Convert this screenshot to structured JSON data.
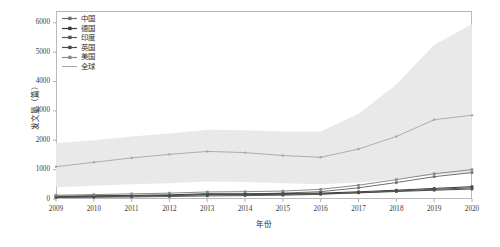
{
  "chart_data": {
    "type": "line",
    "title": "",
    "xlabel": "年份",
    "ylabel": "发文量（篇）",
    "categories": [
      2009,
      2010,
      2011,
      2012,
      2013,
      2014,
      2015,
      2016,
      2017,
      2018,
      2019,
      2020
    ],
    "xtick_labels": [
      "2009",
      "2010",
      "2011",
      "2012",
      "2013",
      "2014",
      "2015",
      "2016",
      "2017",
      "2018",
      "2019",
      "2020"
    ],
    "ytick_labels": [
      "0",
      "1000",
      "2000",
      "3000",
      "4000",
      "5000",
      "6000"
    ],
    "ytick_values": [
      0,
      1000,
      2000,
      3000,
      4000,
      5000,
      6000
    ],
    "ylim": [
      0,
      6400
    ],
    "xlim": [
      2009,
      2020
    ],
    "grid": false,
    "legend_position": "upper-left-inside",
    "series": [
      {
        "name": "中国",
        "color": "#6f6f6f",
        "marker": "square",
        "values": [
          60,
          75,
          95,
          120,
          150,
          170,
          200,
          250,
          380,
          560,
          760,
          900
        ]
      },
      {
        "name": "德国",
        "color": "#3a3a3a",
        "marker": "square",
        "values": [
          95,
          110,
          125,
          140,
          180,
          175,
          185,
          200,
          245,
          300,
          360,
          420
        ]
      },
      {
        "name": "印度",
        "color": "#565656",
        "marker": "square",
        "values": [
          50,
          60,
          70,
          85,
          105,
          115,
          130,
          160,
          215,
          275,
          330,
          380
        ]
      },
      {
        "name": "英国",
        "color": "#4a4a4a",
        "marker": "square",
        "values": [
          80,
          90,
          105,
          120,
          145,
          150,
          160,
          175,
          210,
          255,
          300,
          340
        ]
      },
      {
        "name": "美国",
        "color": "#8a8a8a",
        "marker": "square",
        "values": [
          130,
          150,
          175,
          200,
          240,
          250,
          270,
          330,
          470,
          660,
          860,
          1000
        ]
      },
      {
        "name": "全球",
        "color": "#a6a6a6",
        "marker": "dot",
        "values": [
          1100,
          1250,
          1400,
          1520,
          1620,
          1580,
          1480,
          1420,
          1700,
          2130,
          2700,
          2850
        ]
      }
    ],
    "band": {
      "name": "全球区间",
      "color": "#e8e8e8",
      "upper": [
        1900,
        2000,
        2130,
        2230,
        2360,
        2340,
        2300,
        2300,
        2900,
        3900,
        5250,
        5950
      ],
      "lower": [
        400,
        450,
        500,
        540,
        600,
        580,
        540,
        500,
        560,
        680,
        820,
        900
      ]
    }
  }
}
